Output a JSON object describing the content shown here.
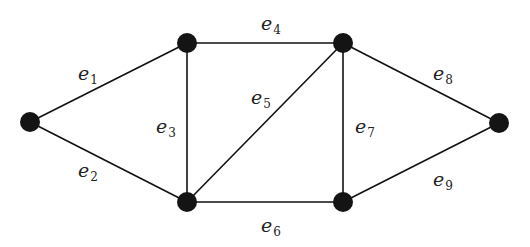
{
  "diagram": {
    "type": "undirected-graph",
    "colors": {
      "background": "#ffffff",
      "node": "#141414",
      "edge": "#111111",
      "label": "#222222"
    },
    "nodes": [
      {
        "id": "v1",
        "x": 30,
        "y": 122
      },
      {
        "id": "v2",
        "x": 187,
        "y": 43
      },
      {
        "id": "v3",
        "x": 187,
        "y": 202
      },
      {
        "id": "v4",
        "x": 343,
        "y": 43
      },
      {
        "id": "v5",
        "x": 343,
        "y": 202
      },
      {
        "id": "v6",
        "x": 499,
        "y": 123
      }
    ],
    "edges": [
      {
        "id": "e1",
        "symbol": "e",
        "index": "1",
        "from": "v1",
        "to": "v2",
        "label_x": 78,
        "label_y": 80
      },
      {
        "id": "e2",
        "symbol": "e",
        "index": "2",
        "from": "v1",
        "to": "v3",
        "label_x": 78,
        "label_y": 177
      },
      {
        "id": "e3",
        "symbol": "e",
        "index": "3",
        "from": "v2",
        "to": "v3",
        "label_x": 156,
        "label_y": 133
      },
      {
        "id": "e4",
        "symbol": "e",
        "index": "4",
        "from": "v2",
        "to": "v4",
        "label_x": 261,
        "label_y": 30
      },
      {
        "id": "e5",
        "symbol": "e",
        "index": "5",
        "from": "v3",
        "to": "v4",
        "label_x": 251,
        "label_y": 104
      },
      {
        "id": "e6",
        "symbol": "e",
        "index": "6",
        "from": "v3",
        "to": "v5",
        "label_x": 261,
        "label_y": 232
      },
      {
        "id": "e7",
        "symbol": "e",
        "index": "7",
        "from": "v4",
        "to": "v5",
        "label_x": 355,
        "label_y": 133
      },
      {
        "id": "e8",
        "symbol": "e",
        "index": "8",
        "from": "v4",
        "to": "v6",
        "label_x": 433,
        "label_y": 80
      },
      {
        "id": "e9",
        "symbol": "e",
        "index": "9",
        "from": "v5",
        "to": "v6",
        "label_x": 433,
        "label_y": 186
      }
    ]
  }
}
